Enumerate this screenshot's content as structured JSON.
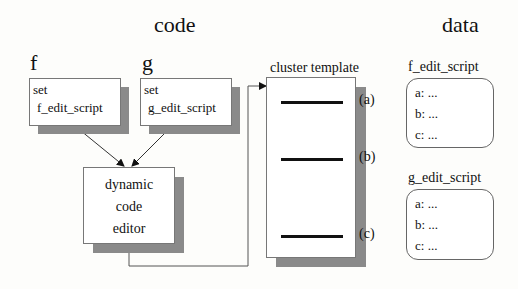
{
  "sections": {
    "code_title": "code",
    "data_title": "data"
  },
  "functions": [
    {
      "name": "f",
      "box_line1": "set",
      "box_line2": "f_edit_script"
    },
    {
      "name": "g",
      "box_line1": "set",
      "box_line2": "g_edit_script"
    }
  ],
  "editor": {
    "line1": "dynamic",
    "line2": "code",
    "line3": "editor"
  },
  "template": {
    "title": "cluster template",
    "slots": [
      "(a)",
      "(b)",
      "(c)"
    ]
  },
  "data_scripts": [
    {
      "title": "f_edit_script",
      "entries": [
        "a: ...",
        "b: ...",
        "c: ..."
      ]
    },
    {
      "title": "g_edit_script",
      "entries": [
        "a: ...",
        "b: ...",
        "c: ..."
      ]
    }
  ],
  "colors": {
    "shadow": "#8a8a8a",
    "border": "#777777",
    "line": "#111111"
  }
}
